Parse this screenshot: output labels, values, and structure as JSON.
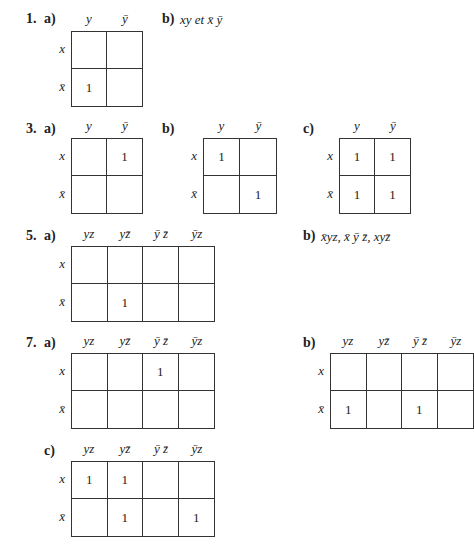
{
  "exercises": [
    {
      "number": "1.",
      "a": {
        "label": "a)",
        "cols": [
          "y",
          "ȳ"
        ],
        "rows": [
          "x",
          "x̄"
        ],
        "cells": [
          [
            "",
            ""
          ],
          [
            "1",
            ""
          ]
        ]
      },
      "b": {
        "label": "b)",
        "text": "xy et x̄ ȳ"
      }
    },
    {
      "number": "3.",
      "a": {
        "label": "a)",
        "cols": [
          "y",
          "ȳ"
        ],
        "rows": [
          "x",
          "x̄"
        ],
        "cells": [
          [
            "",
            "1"
          ],
          [
            "",
            ""
          ]
        ]
      },
      "b": {
        "label": "b)",
        "cols": [
          "y",
          "ȳ"
        ],
        "rows": [
          "x",
          "x̄"
        ],
        "cells": [
          [
            "1",
            ""
          ],
          [
            "",
            "1"
          ]
        ]
      },
      "c": {
        "label": "c)",
        "cols": [
          "y",
          "ȳ"
        ],
        "rows": [
          "x",
          "x̄"
        ],
        "cells": [
          [
            "1",
            "1"
          ],
          [
            "1",
            "1"
          ]
        ]
      }
    },
    {
      "number": "5.",
      "a": {
        "label": "a)",
        "cols": [
          "yz",
          "yz̄",
          "ȳ z̄",
          "ȳz"
        ],
        "rows": [
          "x",
          "x̄"
        ],
        "cells": [
          [
            "",
            "",
            "",
            ""
          ],
          [
            "",
            "1",
            "",
            ""
          ]
        ]
      },
      "b": {
        "label": "b)",
        "text": "x̄yz, x̄ ȳ z̄, xyz̄"
      }
    },
    {
      "number": "7.",
      "a": {
        "label": "a)",
        "cols": [
          "yz",
          "yz̄",
          "ȳ z̄",
          "ȳz"
        ],
        "rows": [
          "x",
          "x̄"
        ],
        "cells": [
          [
            "",
            "",
            "1",
            ""
          ],
          [
            "",
            "",
            "",
            ""
          ]
        ]
      },
      "b": {
        "label": "b)",
        "cols": [
          "yz",
          "yz̄",
          "ȳ z̄",
          "ȳz"
        ],
        "rows": [
          "x",
          "x̄"
        ],
        "cells": [
          [
            "",
            "",
            "",
            ""
          ],
          [
            "1",
            "",
            "1",
            ""
          ]
        ]
      },
      "c": {
        "label": "c)",
        "cols": [
          "yz",
          "yz̄",
          "ȳ z̄",
          "ȳz"
        ],
        "rows": [
          "x",
          "x̄"
        ],
        "cells": [
          [
            "1",
            "1",
            "",
            ""
          ],
          [
            "",
            "1",
            "",
            "1"
          ]
        ]
      }
    }
  ]
}
